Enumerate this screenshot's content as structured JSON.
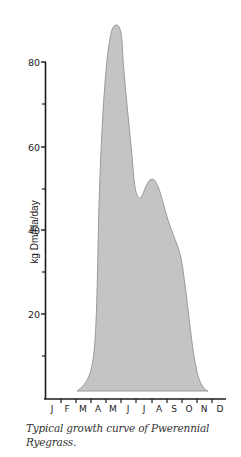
{
  "chart_data": {
    "type": "area",
    "title": "",
    "caption": "Typical growth curve of Pwerennial Ryegrass.",
    "xlabel": "",
    "ylabel": "kg Dm/Ha/day",
    "categories": [
      "J",
      "F",
      "M",
      "A",
      "M",
      "J",
      "J",
      "A",
      "S",
      "O",
      "N",
      "D"
    ],
    "months": [
      "Jan",
      "Feb",
      "Mar",
      "Apr",
      "May",
      "Jun",
      "Jul",
      "Aug",
      "Sep",
      "Oct",
      "Nov",
      "Dec"
    ],
    "values": [
      0,
      0,
      2,
      20,
      88,
      48,
      52,
      36,
      20,
      5,
      2,
      0
    ],
    "key_points": [
      {
        "label": "growth start (early Mar)",
        "value": 2
      },
      {
        "label": "peak (late May)",
        "value": 88
      },
      {
        "label": "dip (late Jun)",
        "value": 48
      },
      {
        "label": "secondary peak (mid Jul)",
        "value": 52
      },
      {
        "label": "shoulder (Aug)",
        "value": 35
      },
      {
        "label": "growth end (late Nov)",
        "value": 2
      }
    ],
    "ylim": [
      0,
      90
    ],
    "yticks_major": [
      20,
      40,
      60,
      80
    ],
    "yticks_minor": [
      10,
      30,
      50,
      70
    ],
    "grid": false,
    "legend": "none",
    "fill_color": "#c4c4c4",
    "stroke_color": "#9a9a9a"
  },
  "axis": {
    "y_ticks": [
      {
        "label": "80",
        "y": 62
      },
      {
        "label": "60",
        "y": 147
      },
      {
        "label": "40",
        "y": 230
      },
      {
        "label": "20",
        "y": 314
      }
    ],
    "y_minor": [
      104,
      189,
      272,
      356
    ],
    "x_labels": [
      {
        "label": "J",
        "x": 52
      },
      {
        "label": "F",
        "x": 67
      },
      {
        "label": "M",
        "x": 83
      },
      {
        "label": "A",
        "x": 98
      },
      {
        "label": "M",
        "x": 113
      },
      {
        "label": "J",
        "x": 128
      },
      {
        "label": "J",
        "x": 144
      },
      {
        "label": "A",
        "x": 159
      },
      {
        "label": "S",
        "x": 174
      },
      {
        "label": "O",
        "x": 189
      },
      {
        "label": "N",
        "x": 204
      },
      {
        "label": "D",
        "x": 220
      }
    ],
    "x_ticks": [
      61,
      76,
      91,
      106,
      121,
      136,
      152,
      167,
      182,
      197,
      212
    ]
  },
  "caption": {
    "line1": "Typical growth curve of Pwerennial",
    "line2": "Ryegrass."
  }
}
